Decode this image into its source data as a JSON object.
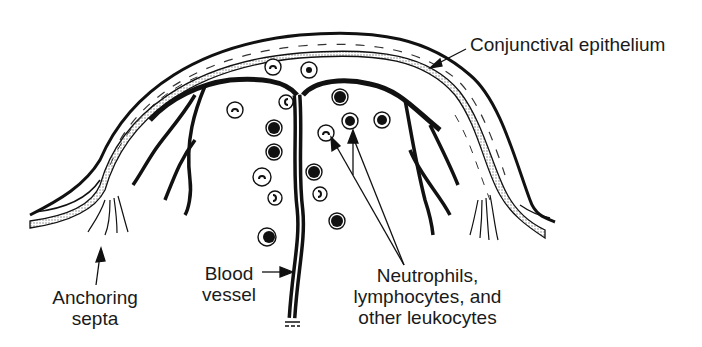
{
  "figure": {
    "colors": {
      "ink": "#111111",
      "stipple": "#9a9a9a",
      "background": "#ffffff"
    }
  },
  "labels": {
    "conjunctival_epithelium": {
      "lines": [
        "Conjunctival epithelium"
      ]
    },
    "anchoring_septa": {
      "lines": [
        "Anchoring",
        "septa"
      ]
    },
    "blood_vessel": {
      "lines": [
        "Blood",
        "vessel"
      ]
    },
    "leukocytes": {
      "lines": [
        "Neutrophils,",
        "lymphocytes, and",
        "other leukocytes"
      ]
    }
  },
  "structures": {
    "layers": [
      "outer epithelial surface",
      "stippled basement layer",
      "inner boundary"
    ],
    "vessel": "central vertical blood vessel branching at the apex into left and right arcades",
    "cell_count": 16
  }
}
